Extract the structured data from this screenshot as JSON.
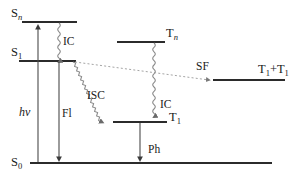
{
  "diagram": {
    "levels": [
      {
        "id": "S_n",
        "base": "S",
        "sub": "n",
        "sub_italic": true,
        "label_x": 11,
        "label_y": 17,
        "line_x1": 22,
        "line_x2": 77,
        "line_y": 22
      },
      {
        "id": "S_1",
        "base": "S",
        "sub": "1",
        "sub_italic": false,
        "label_x": 11,
        "label_y": 56,
        "line_x1": 19,
        "line_x2": 76,
        "line_y": 61
      },
      {
        "id": "T_n",
        "base": "T",
        "sub": "n",
        "sub_italic": true,
        "label_x": 166,
        "label_y": 37,
        "line_x1": 117,
        "line_x2": 165,
        "line_y": 42
      },
      {
        "id": "T_1",
        "base": "T",
        "sub": "1",
        "sub_italic": false,
        "label_x": 168,
        "label_y": 121,
        "line_x1": 113,
        "line_x2": 167,
        "line_y": 122
      },
      {
        "id": "T_1+T_1",
        "base": "T",
        "sub": "1",
        "sub_italic": false,
        "plus": "+T",
        "label_x": 258,
        "label_y": 73,
        "line_x1": 213,
        "line_x2": 285,
        "line_y": 80
      },
      {
        "id": "S_0",
        "base": "S",
        "sub": "0",
        "sub_italic": false,
        "label_x": 11,
        "label_y": 166,
        "line_x1": 30,
        "line_x2": 272,
        "line_y": 163
      }
    ],
    "processes": [
      {
        "id": "absorption",
        "label": "hν",
        "label_x": 19,
        "label_y": 116,
        "style": "italic",
        "kind": "straight",
        "x1": 38,
        "y1": 162,
        "x2": 38,
        "y2": 24,
        "arrow": "end"
      },
      {
        "id": "ic-singlet",
        "label": "IC",
        "label_x": 63,
        "label_y": 45,
        "style": "normal",
        "kind": "wavy",
        "x1": 59,
        "y1": 23,
        "x2": 59,
        "y2": 60,
        "arrow": "end"
      },
      {
        "id": "fluorescence",
        "label": "Fl",
        "label_x": 62,
        "label_y": 117,
        "style": "normal",
        "kind": "straight",
        "x1": 59,
        "y1": 62,
        "x2": 59,
        "y2": 162,
        "arrow": "end"
      },
      {
        "id": "isc",
        "label": "ISC",
        "label_x": 87,
        "label_y": 99,
        "style": "normal",
        "kind": "wavy-diag",
        "x1": 73,
        "y1": 62,
        "x2": 116,
        "y2": 121,
        "arrow": "end"
      },
      {
        "id": "ic-triplet",
        "label": "IC",
        "label_x": 160,
        "label_y": 108,
        "style": "normal",
        "kind": "wavy",
        "x1": 154,
        "y1": 43,
        "x2": 154,
        "y2": 121,
        "arrow": "end"
      },
      {
        "id": "singlet-fission",
        "label": "SF",
        "label_x": 196,
        "label_y": 70,
        "style": "normal",
        "kind": "dotted",
        "x1": 75,
        "y1": 62,
        "x2": 212,
        "y2": 80,
        "arrow": "end"
      },
      {
        "id": "phosphorescence",
        "label": "Ph",
        "label_x": 148,
        "label_y": 153,
        "style": "normal",
        "kind": "straight",
        "x1": 140,
        "y1": 123,
        "x2": 140,
        "y2": 162,
        "arrow": "end"
      }
    ],
    "colors": {
      "level_line": "#2b2b2b",
      "straight_arrow": "#4a4a4a",
      "wavy_arrow": "#8a8a8a",
      "dotted_arrow": "#9a9a9a",
      "text": "#1a1a1a",
      "background": "#ffffff"
    }
  }
}
